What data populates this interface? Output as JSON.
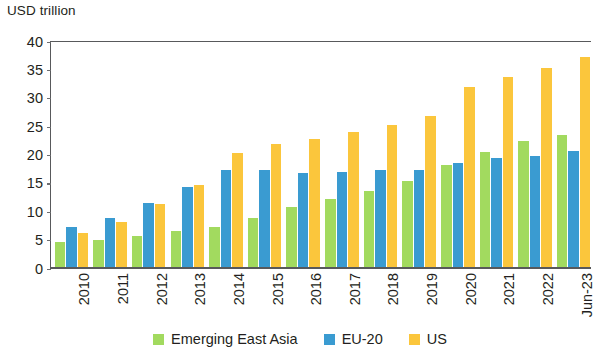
{
  "chart_data": {
    "type": "bar",
    "title": "",
    "subtitle": "",
    "xlabel": "",
    "ylabel": "USD trillion",
    "ylim": [
      0,
      40
    ],
    "ytick_step": 5,
    "yticks": [
      "40",
      "35",
      "30",
      "25",
      "20",
      "15",
      "10",
      "5",
      "0"
    ],
    "grid": false,
    "legend_position": "bottom-center",
    "categories": [
      "2010",
      "2011",
      "2012",
      "2013",
      "2014",
      "2015",
      "2016",
      "2017",
      "2018",
      "2019",
      "2020",
      "2021",
      "2022",
      "Jun-23"
    ],
    "series": [
      {
        "name": "Emerging East Asia",
        "color": "#a2da5f",
        "values": [
          4.6,
          4.9,
          5.7,
          6.6,
          7.3,
          8.9,
          10.7,
          12.1,
          13.6,
          15.4,
          18.2,
          20.4,
          22.3,
          23.4
        ]
      },
      {
        "name": "EU-20",
        "color": "#3a9bd1",
        "values": [
          7.2,
          8.8,
          11.4,
          14.2,
          17.2,
          17.2,
          16.8,
          17.0,
          17.2,
          17.3,
          18.5,
          19.4,
          19.7,
          20.7
        ]
      },
      {
        "name": "US",
        "color": "#fbc63c",
        "values": [
          6.2,
          8.1,
          11.3,
          14.6,
          20.3,
          21.8,
          22.8,
          23.9,
          25.2,
          26.7,
          31.9,
          33.7,
          35.2,
          37.1
        ]
      }
    ]
  },
  "legend": {
    "items": [
      {
        "label": "Emerging East Asia",
        "color": "#a2da5f"
      },
      {
        "label": "EU-20",
        "color": "#3a9bd1"
      },
      {
        "label": "US",
        "color": "#fbc63c"
      }
    ]
  }
}
